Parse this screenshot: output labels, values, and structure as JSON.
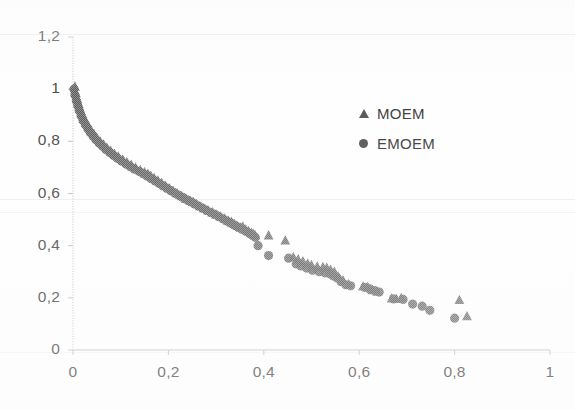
{
  "chart_data": {
    "type": "scatter",
    "title": "",
    "subtitle": "",
    "xlabel": "",
    "ylabel": "",
    "xlim": [
      0,
      1
    ],
    "ylim": [
      0,
      1.2
    ],
    "xticks": [
      "0",
      "0,2",
      "0,4",
      "0,6",
      "0,8",
      "1"
    ],
    "xtick_values": [
      0,
      0.2,
      0.4,
      0.6,
      0.8,
      1
    ],
    "yticks": [
      "0",
      "0,2",
      "0,4",
      "0,6",
      "0,8",
      "1",
      "1,2"
    ],
    "ytick_values": [
      0,
      0.2,
      0.4,
      0.6,
      0.8,
      1,
      1.2
    ],
    "grid": false,
    "legend_position": "upper-right",
    "decimal_separator": ",",
    "marker_color": "#555555",
    "axis_color": "#bfbfbf",
    "series": [
      {
        "name": "MOEM",
        "marker": "triangle",
        "color": "#555555",
        "points": [
          [
            0.004,
            1.01
          ],
          [
            0.006,
            0.985
          ],
          [
            0.009,
            0.962
          ],
          [
            0.012,
            0.944
          ],
          [
            0.015,
            0.926
          ],
          [
            0.019,
            0.906
          ],
          [
            0.023,
            0.888
          ],
          [
            0.028,
            0.872
          ],
          [
            0.033,
            0.856
          ],
          [
            0.038,
            0.842
          ],
          [
            0.044,
            0.828
          ],
          [
            0.05,
            0.814
          ],
          [
            0.057,
            0.8
          ],
          [
            0.064,
            0.788
          ],
          [
            0.071,
            0.776
          ],
          [
            0.079,
            0.764
          ],
          [
            0.087,
            0.752
          ],
          [
            0.095,
            0.742
          ],
          [
            0.104,
            0.731
          ],
          [
            0.113,
            0.72
          ],
          [
            0.122,
            0.71
          ],
          [
            0.131,
            0.7
          ],
          [
            0.141,
            0.69
          ],
          [
            0.15,
            0.682
          ],
          [
            0.157,
            0.676
          ],
          [
            0.163,
            0.668
          ],
          [
            0.17,
            0.66
          ],
          [
            0.178,
            0.65
          ],
          [
            0.186,
            0.64
          ],
          [
            0.194,
            0.63
          ],
          [
            0.202,
            0.62
          ],
          [
            0.21,
            0.61
          ],
          [
            0.219,
            0.6
          ],
          [
            0.228,
            0.59
          ],
          [
            0.237,
            0.58
          ],
          [
            0.246,
            0.572
          ],
          [
            0.252,
            0.568
          ],
          [
            0.258,
            0.56
          ],
          [
            0.266,
            0.552
          ],
          [
            0.274,
            0.544
          ],
          [
            0.283,
            0.536
          ],
          [
            0.292,
            0.528
          ],
          [
            0.3,
            0.52
          ],
          [
            0.309,
            0.512
          ],
          [
            0.318,
            0.504
          ],
          [
            0.326,
            0.496
          ],
          [
            0.332,
            0.492
          ],
          [
            0.338,
            0.484
          ],
          [
            0.345,
            0.476
          ],
          [
            0.352,
            0.47
          ],
          [
            0.356,
            0.474
          ],
          [
            0.362,
            0.462
          ],
          [
            0.368,
            0.456
          ],
          [
            0.374,
            0.45
          ],
          [
            0.378,
            0.446
          ],
          [
            0.382,
            0.44
          ],
          [
            0.41,
            0.44
          ],
          [
            0.445,
            0.42
          ],
          [
            0.462,
            0.356
          ],
          [
            0.472,
            0.348
          ],
          [
            0.482,
            0.34
          ],
          [
            0.492,
            0.332
          ],
          [
            0.5,
            0.326
          ],
          [
            0.512,
            0.32
          ],
          [
            0.524,
            0.318
          ],
          [
            0.532,
            0.316
          ],
          [
            0.54,
            0.308
          ],
          [
            0.548,
            0.3
          ],
          [
            0.556,
            0.282
          ],
          [
            0.566,
            0.268
          ],
          [
            0.578,
            0.252
          ],
          [
            0.608,
            0.244
          ],
          [
            0.618,
            0.242
          ],
          [
            0.628,
            0.23
          ],
          [
            0.638,
            0.224
          ],
          [
            0.668,
            0.198
          ],
          [
            0.678,
            0.196
          ],
          [
            0.688,
            0.2
          ],
          [
            0.81,
            0.192
          ],
          [
            0.826,
            0.13
          ]
        ]
      },
      {
        "name": "EMOEM",
        "marker": "circle",
        "color": "#555555",
        "points": [
          [
            0.002,
            1.0
          ],
          [
            0.004,
            0.978
          ],
          [
            0.007,
            0.956
          ],
          [
            0.01,
            0.936
          ],
          [
            0.013,
            0.918
          ],
          [
            0.017,
            0.898
          ],
          [
            0.021,
            0.88
          ],
          [
            0.026,
            0.864
          ],
          [
            0.031,
            0.848
          ],
          [
            0.036,
            0.834
          ],
          [
            0.042,
            0.82
          ],
          [
            0.048,
            0.806
          ],
          [
            0.055,
            0.793
          ],
          [
            0.062,
            0.781
          ],
          [
            0.069,
            0.769
          ],
          [
            0.077,
            0.757
          ],
          [
            0.085,
            0.746
          ],
          [
            0.093,
            0.735
          ],
          [
            0.102,
            0.724
          ],
          [
            0.111,
            0.713
          ],
          [
            0.12,
            0.703
          ],
          [
            0.129,
            0.693
          ],
          [
            0.139,
            0.684
          ],
          [
            0.148,
            0.675
          ],
          [
            0.156,
            0.666
          ],
          [
            0.164,
            0.657
          ],
          [
            0.172,
            0.648
          ],
          [
            0.18,
            0.639
          ],
          [
            0.188,
            0.63
          ],
          [
            0.196,
            0.621
          ],
          [
            0.204,
            0.612
          ],
          [
            0.212,
            0.603
          ],
          [
            0.221,
            0.594
          ],
          [
            0.23,
            0.585
          ],
          [
            0.239,
            0.576
          ],
          [
            0.248,
            0.567
          ],
          [
            0.256,
            0.559
          ],
          [
            0.264,
            0.551
          ],
          [
            0.272,
            0.543
          ],
          [
            0.28,
            0.535
          ],
          [
            0.289,
            0.527
          ],
          [
            0.298,
            0.519
          ],
          [
            0.306,
            0.511
          ],
          [
            0.314,
            0.503
          ],
          [
            0.322,
            0.495
          ],
          [
            0.33,
            0.487
          ],
          [
            0.338,
            0.479
          ],
          [
            0.346,
            0.471
          ],
          [
            0.354,
            0.463
          ],
          [
            0.362,
            0.455
          ],
          [
            0.37,
            0.447
          ],
          [
            0.376,
            0.44
          ],
          [
            0.382,
            0.432
          ],
          [
            0.388,
            0.4
          ],
          [
            0.41,
            0.362
          ],
          [
            0.452,
            0.352
          ],
          [
            0.468,
            0.33
          ],
          [
            0.478,
            0.322
          ],
          [
            0.49,
            0.314
          ],
          [
            0.502,
            0.306
          ],
          [
            0.516,
            0.3
          ],
          [
            0.528,
            0.296
          ],
          [
            0.538,
            0.292
          ],
          [
            0.546,
            0.284
          ],
          [
            0.554,
            0.276
          ],
          [
            0.562,
            0.262
          ],
          [
            0.572,
            0.25
          ],
          [
            0.582,
            0.246
          ],
          [
            0.612,
            0.24
          ],
          [
            0.622,
            0.234
          ],
          [
            0.632,
            0.228
          ],
          [
            0.642,
            0.222
          ],
          [
            0.672,
            0.196
          ],
          [
            0.692,
            0.194
          ],
          [
            0.712,
            0.176
          ],
          [
            0.732,
            0.168
          ],
          [
            0.748,
            0.152
          ],
          [
            0.8,
            0.122
          ]
        ]
      }
    ]
  },
  "legend": {
    "items": [
      {
        "label": "MOEM",
        "marker": "triangle"
      },
      {
        "label": "EMOEM",
        "marker": "circle"
      }
    ]
  }
}
